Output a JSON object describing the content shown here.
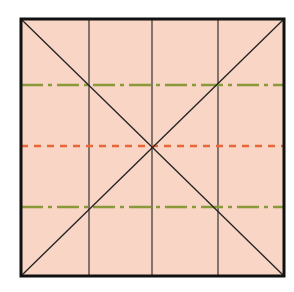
{
  "diagram": {
    "type": "grid-square",
    "colors": {
      "background": "#ffffff",
      "fill": "#f9d5c5",
      "border": "#111111",
      "lines": "#222222",
      "green_guide": "#8a9a3a",
      "orange_guide": "#e8673a"
    },
    "vertical_lines": 3,
    "horizontal_guides": [
      {
        "style": "dash-dot",
        "color": "green",
        "position": "upper"
      },
      {
        "style": "dashed",
        "color": "orange",
        "position": "middle"
      },
      {
        "style": "dash-dot",
        "color": "green",
        "position": "lower"
      }
    ],
    "diagonals": 2
  }
}
